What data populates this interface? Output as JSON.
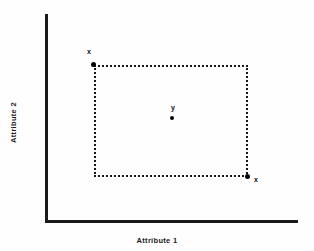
{
  "figure": {
    "background_color": "#fefefe",
    "ink_color": "#1a1a1a"
  },
  "axes": {
    "x_title": "Attribute 1",
    "y_title": "Attribute 2"
  },
  "chart_data": {
    "type": "scatter",
    "title": "",
    "xlabel": "Attribute 1",
    "ylabel": "Attribute 2",
    "grid": false,
    "legend": "none",
    "axis_ticks": {
      "x": [],
      "y": []
    },
    "annotations": [
      {
        "name": "bounding-rectangle",
        "shape": "rectangle",
        "style": "dotted",
        "color": "#161616",
        "corners": {
          "top_left": [
            94,
            65
          ],
          "top_right": [
            248,
            65
          ],
          "bottom_right": [
            248,
            177
          ],
          "bottom_left": [
            94,
            177
          ]
        }
      }
    ],
    "points": [
      {
        "label": "x",
        "role": "upper-left-corner",
        "x_px": 94,
        "y_px": 65,
        "label_position": "above-left"
      },
      {
        "label": "y",
        "role": "center",
        "x_px": 172,
        "y_px": 118,
        "label_position": "above"
      },
      {
        "label": "x",
        "role": "lower-right-corner",
        "x_px": 248,
        "y_px": 177,
        "label_position": "below-right"
      }
    ]
  },
  "labels": {
    "point_x_top_left": "x",
    "point_y_center": "y",
    "point_x_bottom_right": "x"
  }
}
